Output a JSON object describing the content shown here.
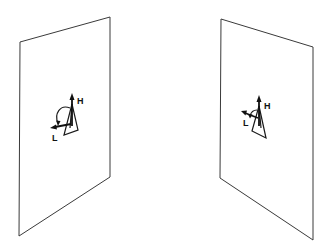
{
  "figure": {
    "panels": [
      {
        "id": "left",
        "corners": [
          [
            20,
            42
          ],
          [
            110,
            17
          ],
          [
            110,
            177
          ],
          [
            19,
            236
          ]
        ],
        "labels": {
          "h": "H",
          "l": "L"
        }
      },
      {
        "id": "right",
        "corners": [
          [
            221,
            19
          ],
          [
            313,
            47
          ],
          [
            313,
            240
          ],
          [
            220,
            178
          ]
        ],
        "labels": {
          "h": "H",
          "l": "L"
        }
      }
    ],
    "colors": {
      "line": "#3a3a3a",
      "ink": "#111111",
      "background": "#ffffff"
    }
  }
}
